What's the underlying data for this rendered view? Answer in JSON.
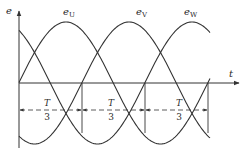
{
  "diagram": {
    "type": "three-phase-sinusoidal-emf",
    "axes": {
      "y_label": "e",
      "x_label": "t"
    },
    "curves": [
      {
        "name": "e_U",
        "label_main": "e",
        "label_sub": "U",
        "phase_deg": 0
      },
      {
        "name": "e_V",
        "label_main": "e",
        "label_sub": "V",
        "phase_deg": -120
      },
      {
        "name": "e_W",
        "label_main": "e",
        "label_sub": "W",
        "phase_deg": -240
      }
    ],
    "intervals": [
      {
        "numerator": "T",
        "denominator": "3"
      },
      {
        "numerator": "T",
        "denominator": "3"
      },
      {
        "numerator": "T",
        "denominator": "3"
      }
    ],
    "colors": {
      "stroke": "#333333",
      "background": "#ffffff"
    }
  }
}
